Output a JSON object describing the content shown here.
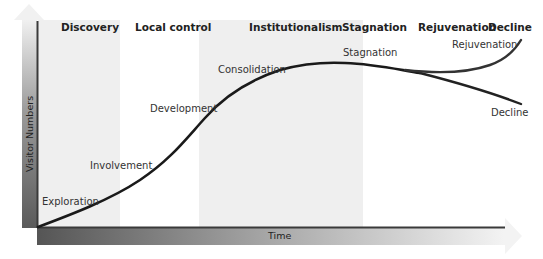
{
  "diagram": {
    "y_axis": {
      "label": "Visitor Numbers"
    },
    "x_axis": {
      "label": "Time"
    },
    "stage_headers": [
      {
        "label": "Discovery"
      },
      {
        "label": "Local control"
      },
      {
        "label": "Institutionalism"
      },
      {
        "label": "Stagnation"
      },
      {
        "label": "Rejuvenation"
      },
      {
        "label": "Decline"
      }
    ],
    "curve_labels": [
      {
        "label": "Exploration"
      },
      {
        "label": "Involvement"
      },
      {
        "label": "Development"
      },
      {
        "label": "Consolidation"
      },
      {
        "label": "Stagnation"
      },
      {
        "label": "Rejuvenation"
      },
      {
        "label": "Decline"
      }
    ],
    "colors": {
      "band": "#efefef",
      "curve": "#1a1a1a",
      "axis_dark": "#4a4a4a",
      "axis_light": "#d8d8d8"
    }
  }
}
